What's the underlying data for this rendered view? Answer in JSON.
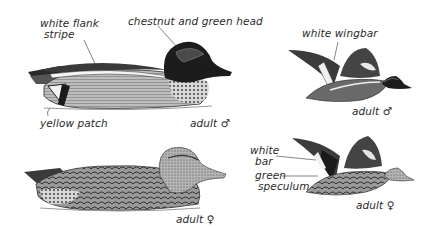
{
  "plate": {
    "subject": "Green-winged Teal field-guide plate",
    "figures": [
      {
        "id": "male-swimming",
        "caption": "adult ♂",
        "callouts": [
          "white flank stripe",
          "chestnut and green head",
          "yellow patch"
        ]
      },
      {
        "id": "male-flying",
        "caption": "adult ♂",
        "callouts": [
          "white wingbar"
        ]
      },
      {
        "id": "female-swimming",
        "caption": "adult ♀",
        "callouts": []
      },
      {
        "id": "female-flying",
        "caption": "adult ♀",
        "callouts": [
          "white bar",
          "green speculum"
        ]
      }
    ]
  },
  "labels": {
    "white_flank_1": "white flank",
    "white_flank_2": "stripe",
    "chestnut_head": "chestnut and green head",
    "yellow_patch": "yellow patch",
    "adult_male_1": "adult ♂",
    "white_wingbar": "white wingbar",
    "adult_male_2": "adult ♂",
    "adult_female_1": "adult ♀",
    "white_bar_1": "white",
    "white_bar_2": "bar",
    "green_speculum_1": "green",
    "green_speculum_2": "speculum",
    "adult_female_2": "adult ♀"
  },
  "colors": {
    "ink": "#1e1e1e",
    "body_gray": "#8a8a8a",
    "light_gray": "#c8c8c8",
    "paper": "#ffffff"
  }
}
